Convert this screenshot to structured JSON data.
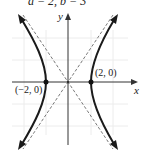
{
  "caption": "a = 2, b = 3",
  "axes": {
    "x_label": "x",
    "y_label": "y"
  },
  "points": [
    {
      "label": "(−2, 0)",
      "x": -2,
      "y": 0
    },
    {
      "label": "(2, 0)",
      "x": 2,
      "y": 0
    }
  ],
  "curve": {
    "type": "hyperbola",
    "equation": "x²/4 − y²/9 = 1",
    "vertices": [
      [
        -2,
        0
      ],
      [
        2,
        0
      ]
    ],
    "asymptotes": [
      "y = 3x/2",
      "y = −3x/2"
    ]
  },
  "colors": {
    "curve": "#1a1a1a",
    "axis": "#333333",
    "asymptote": "#555555",
    "grid": "#e6e6e6"
  }
}
